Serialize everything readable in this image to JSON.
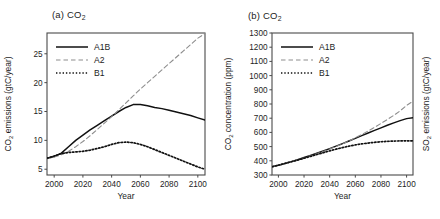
{
  "figure": {
    "panels": [
      {
        "id": "a",
        "title": "(a) CO",
        "title_sub": "2",
        "xlabel": "Year",
        "ylabel": "CO",
        "ylabel_sub": "2",
        "ylabel_rest": " emissions (gtC/year)",
        "xticks": [
          "2000",
          "2020",
          "2040",
          "2060",
          "2080",
          "2100"
        ],
        "yticks": [
          "5",
          "10",
          "15",
          "20",
          "25"
        ],
        "legend": [
          "A1B",
          "A2",
          "B1"
        ]
      },
      {
        "id": "b",
        "title": "(b) CO",
        "title_sub": "2",
        "xlabel": "Year",
        "ylabel": "CO",
        "ylabel_sub": "2",
        "ylabel_rest": " concentration (ppm)",
        "ylabel_right": "SO",
        "ylabel_right_sub": "2",
        "ylabel_right_rest": " emissions (gtC/year)",
        "xticks": [
          "2000",
          "2020",
          "2040",
          "2060",
          "2080",
          "2100"
        ],
        "yticks": [
          "300",
          "400",
          "500",
          "600",
          "700",
          "800",
          "900",
          "1000",
          "1100",
          "1200",
          "1300"
        ],
        "legend": [
          "A1B",
          "A2",
          "B1"
        ]
      }
    ]
  },
  "style": {
    "a1b_color": "#111111",
    "a2_color": "#8d8d8d",
    "b1_color": "#111111",
    "frame_color": "#4a4a4a"
  },
  "chart_data": [
    {
      "type": "line",
      "panel": "a",
      "title": "(a) CO2",
      "xlabel": "Year",
      "ylabel": "CO2 emissions (gtC/year)",
      "xlim": [
        1995,
        2105
      ],
      "ylim": [
        4.0,
        28.6
      ],
      "xticks": [
        2000,
        2020,
        2040,
        2060,
        2080,
        2100
      ],
      "yticks": [
        5,
        10,
        15,
        20,
        25
      ],
      "grid": false,
      "legend_position": "top-left",
      "x": [
        1995,
        2000,
        2005,
        2010,
        2015,
        2020,
        2025,
        2030,
        2035,
        2040,
        2045,
        2050,
        2055,
        2060,
        2065,
        2070,
        2075,
        2080,
        2085,
        2090,
        2095,
        2100,
        2105
      ],
      "series": [
        {
          "name": "A1B",
          "style": "solid",
          "values": [
            6.9,
            7.2,
            7.8,
            8.9,
            10.0,
            10.9,
            11.8,
            12.6,
            13.4,
            14.2,
            15.0,
            15.7,
            16.2,
            16.2,
            16.0,
            15.7,
            15.5,
            15.2,
            14.9,
            14.6,
            14.3,
            13.9,
            13.5
          ]
        },
        {
          "name": "A2",
          "style": "dashed",
          "values": [
            6.8,
            7.1,
            7.5,
            8.1,
            8.9,
            9.8,
            10.8,
            11.9,
            13.0,
            14.1,
            15.3,
            16.5,
            17.7,
            18.9,
            20.0,
            21.1,
            22.2,
            23.3,
            24.4,
            25.5,
            26.6,
            27.7,
            28.5
          ]
        },
        {
          "name": "B1",
          "style": "dotted",
          "values": [
            6.9,
            7.3,
            7.7,
            7.9,
            8.0,
            8.1,
            8.3,
            8.6,
            8.9,
            9.3,
            9.6,
            9.7,
            9.6,
            9.3,
            8.9,
            8.4,
            7.9,
            7.4,
            6.9,
            6.4,
            5.9,
            5.4,
            5.0
          ]
        }
      ]
    },
    {
      "type": "line",
      "panel": "b",
      "title": "(b) CO2",
      "xlabel": "Year",
      "ylabel": "CO2 concentration (ppm)",
      "ylabel_right": "SO2 emissions (gtC/year)",
      "xlim": [
        1995,
        2105
      ],
      "ylim": [
        300,
        1300
      ],
      "xticks": [
        2000,
        2020,
        2040,
        2060,
        2080,
        2100
      ],
      "yticks": [
        300,
        400,
        500,
        600,
        700,
        800,
        900,
        1000,
        1100,
        1200,
        1300
      ],
      "grid": false,
      "legend_position": "top-left",
      "x": [
        1995,
        2000,
        2005,
        2010,
        2015,
        2020,
        2025,
        2030,
        2035,
        2040,
        2045,
        2050,
        2055,
        2060,
        2065,
        2070,
        2075,
        2080,
        2085,
        2090,
        2095,
        2100,
        2105
      ],
      "series": [
        {
          "name": "A1B",
          "style": "solid",
          "values": [
            358,
            369,
            381,
            394,
            408,
            423,
            438,
            453,
            469,
            486,
            503,
            521,
            539,
            558,
            577,
            596,
            614,
            632,
            650,
            667,
            683,
            697,
            704
          ]
        },
        {
          "name": "A2",
          "style": "dashed",
          "values": [
            357,
            368,
            380,
            393,
            406,
            420,
            435,
            450,
            466,
            483,
            501,
            520,
            540,
            562,
            585,
            610,
            636,
            663,
            691,
            720,
            752,
            790,
            820
          ]
        },
        {
          "name": "B1",
          "style": "dotted",
          "values": [
            358,
            369,
            381,
            393,
            405,
            418,
            431,
            444,
            457,
            470,
            482,
            493,
            503,
            512,
            519,
            525,
            530,
            534,
            537,
            539,
            540,
            541,
            541
          ]
        }
      ]
    }
  ]
}
